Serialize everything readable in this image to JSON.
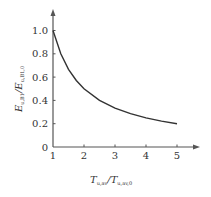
{
  "chart_data": {
    "type": "line",
    "title": "",
    "xlabel": "T_{u,av}/T_{u,av,0}",
    "ylabel": "E_{u,B1}/E_{u,B1,0}",
    "x_ticks": [
      "1",
      "2",
      "3",
      "4",
      "5"
    ],
    "y_ticks": [
      "0",
      "0.2",
      "0.4",
      "0.6",
      "0.8",
      "1.0"
    ],
    "xlim": [
      1,
      5.5
    ],
    "ylim": [
      0,
      1.15
    ],
    "grid": false,
    "legend": null,
    "series": [
      {
        "name": "E ratio",
        "x": [
          1,
          1.25,
          1.5,
          1.75,
          2,
          2.5,
          3,
          3.5,
          4,
          4.5,
          5
        ],
        "y": [
          1.0,
          0.8,
          0.667,
          0.571,
          0.5,
          0.4,
          0.333,
          0.286,
          0.25,
          0.222,
          0.2
        ]
      }
    ]
  },
  "labels": {
    "x_main": "T",
    "x_sub1": "u,av",
    "x_slash": "/",
    "x_main2": "T",
    "x_sub2": "u,av,0",
    "y_main": "E",
    "y_sub1": "u,B1",
    "y_slash": "/",
    "y_main2": "E",
    "y_sub2": "u,B1,0"
  },
  "colors": {
    "axis": "#555555",
    "curve": "#333333",
    "text": "#333333"
  }
}
